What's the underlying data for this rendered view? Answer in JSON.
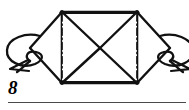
{
  "figure": {
    "label": "8",
    "caption_rule": true,
    "type": "origami-fold-diagram",
    "colors": {
      "ink": "#111111",
      "paper": "#ffffff",
      "rule": "#4a4a4a"
    },
    "geometry": {
      "canvas": {
        "width": 189,
        "height": 110
      },
      "body_rect": {
        "x1": 62,
        "y1": 12,
        "x2": 137,
        "y2": 83
      },
      "center": {
        "x": 100,
        "y": 48
      },
      "left_flap_apex": {
        "x": 30,
        "y": 48
      },
      "right_flap_apex": {
        "x": 170,
        "y": 48
      },
      "fold_lines": [
        {
          "name": "left-chain-fold",
          "x": 62,
          "y1": 12,
          "y2": 83,
          "style": "dash-dot"
        },
        {
          "name": "right-chain-fold",
          "x": 137,
          "y1": 12,
          "y2": 83,
          "style": "dash-dot"
        }
      ]
    },
    "parts": [
      {
        "name": "top-edge",
        "label": "top edge"
      },
      {
        "name": "bottom-edge",
        "label": "bottom edge"
      },
      {
        "name": "left-triangle",
        "label": "left inner triangle"
      },
      {
        "name": "right-triangle",
        "label": "right inner triangle"
      },
      {
        "name": "left-flap",
        "label": "left side flap"
      },
      {
        "name": "right-flap",
        "label": "right side flap"
      }
    ],
    "arrows": [
      {
        "name": "left-rotation-arrow",
        "label": "rotate left side",
        "direction": "counter-clockwise",
        "side": "left"
      },
      {
        "name": "right-rotation-arrow",
        "label": "rotate right side",
        "direction": "clockwise",
        "side": "right"
      }
    ]
  }
}
